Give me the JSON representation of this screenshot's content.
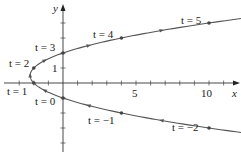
{
  "chart_data": {
    "type": "line",
    "title": "",
    "parametric": true,
    "equations": {
      "x": "t^2 - 3t",
      "y": "t - 1"
    },
    "xlabel": "x",
    "ylabel": "y",
    "xlim": [
      -4,
      11.8
    ],
    "ylim": [
      -4.6,
      5.2
    ],
    "grid": false,
    "x_tick_labels": [
      {
        "value": 5,
        "label": "5"
      },
      {
        "value": 10,
        "label": "10"
      }
    ],
    "y_tick_labels": [
      {
        "value": 1,
        "label": "1"
      }
    ],
    "x_ticks": [
      -3,
      -2,
      -1,
      1,
      2,
      3,
      4,
      5,
      6,
      7,
      8,
      9,
      10,
      11
    ],
    "y_ticks": [
      -4,
      -3,
      -2,
      -1,
      1,
      2,
      3,
      4
    ],
    "series": [
      {
        "name": "parametric curve",
        "points": [
          {
            "t": -2,
            "x": 10,
            "y": -3,
            "label": "t = −2"
          },
          {
            "t": -1,
            "x": 4,
            "y": -2,
            "label": "t = −1"
          },
          {
            "t": 0,
            "x": 0,
            "y": -1,
            "label": "t = 0"
          },
          {
            "t": 1,
            "x": -2,
            "y": 0,
            "label": "t = 1"
          },
          {
            "t": 2,
            "x": -2,
            "y": 1,
            "label": "t = 2"
          },
          {
            "t": 3,
            "x": 0,
            "y": 2,
            "label": "t = 3"
          },
          {
            "t": 4,
            "x": 4,
            "y": 3,
            "label": "t = 4"
          },
          {
            "t": 5,
            "x": 10,
            "y": 4,
            "label": "t = 5"
          }
        ],
        "t_range": [
          -2.4,
          5.3
        ],
        "direction_arrows": "increasing t"
      }
    ]
  },
  "labels": {
    "x_axis": "x",
    "y_axis": "y",
    "tick_5": "5",
    "tick_10": "10",
    "tick_y1": "1",
    "t_neg2": "t = −2",
    "t_neg1": "t = −1",
    "t_0": "t = 0",
    "t_1": "t = 1",
    "t_2": "t = 2",
    "t_3": "t = 3",
    "t_4": "t = 4",
    "t_5": "t = 5"
  }
}
